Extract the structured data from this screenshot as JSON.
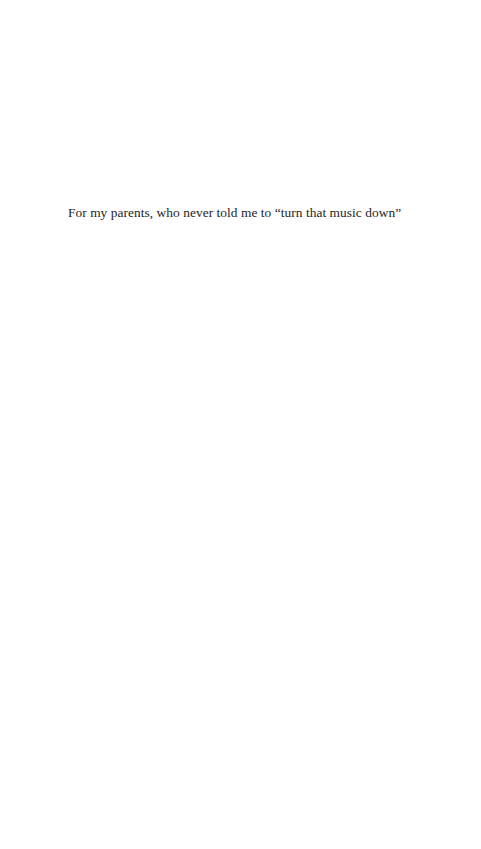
{
  "page": {
    "type": "dedication",
    "dedication_text": "For my parents, who never told me to “turn that music down”"
  }
}
